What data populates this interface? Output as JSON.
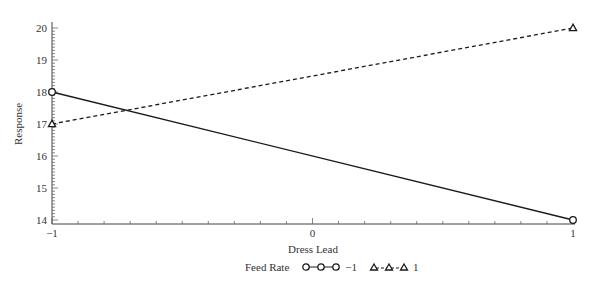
{
  "chart_data": {
    "type": "line",
    "title": "",
    "xlabel": "Dress Lead",
    "ylabel": "Response",
    "x": [
      -1,
      1
    ],
    "x_ticks": [
      -1,
      0,
      1
    ],
    "y_ticks": [
      14,
      15,
      16,
      17,
      18,
      19,
      20
    ],
    "xlim": [
      -1,
      1
    ],
    "ylim": [
      13.9,
      20.2
    ],
    "grid": false,
    "legend_title": "Feed Rate",
    "legend_position": "bottom",
    "series": [
      {
        "name": "-1",
        "legend_label": "−1",
        "values": [
          18,
          14
        ],
        "marker": "circle",
        "line_style": "solid",
        "color": "#1a1a1a"
      },
      {
        "name": "1",
        "legend_label": "1",
        "values": [
          17,
          20
        ],
        "marker": "triangle",
        "line_style": "dashed",
        "color": "#1a1a1a"
      }
    ]
  },
  "labels": {
    "x_tick_labels": [
      "−1",
      "0",
      "1"
    ],
    "y_tick_labels": [
      "14",
      "15",
      "16",
      "17",
      "18",
      "19",
      "20"
    ]
  }
}
